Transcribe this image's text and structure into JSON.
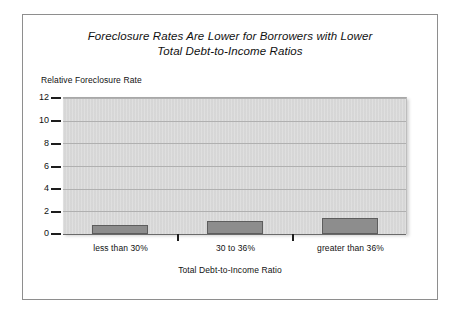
{
  "chart_data": {
    "type": "bar",
    "title": "Foreclosure Rates Are Lower for Borrowers with Lower Total Debt-to-Income Ratios",
    "title_lines": [
      "Foreclosure Rates Are Lower for Borrowers with Lower",
      "Total Debt-to-Income Ratios"
    ],
    "categories": [
      "less than 30%",
      "30 to 36%",
      "greater than 36%"
    ],
    "values": [
      0.8,
      1.1,
      1.4
    ],
    "xlabel": "Total Debt-to-Income Ratio",
    "ylabel": "Relative Foreclosure Rate",
    "ylim": [
      0,
      12
    ],
    "ytick_labels": [
      "12",
      "10",
      "8",
      "6",
      "4",
      "2",
      "0"
    ],
    "ytick_values": [
      12,
      10,
      8,
      6,
      4,
      2,
      0
    ],
    "grid": true,
    "legend": false,
    "legend_position": "none",
    "colors": {
      "bar_fill": "#8d8d8d",
      "bar_border": "#5d5d5d",
      "plot_background": "#d9d9d9",
      "gridline": "#b0b0b0",
      "axis": "#1d1d1d",
      "frame_border": "#8e8e8e",
      "text": "#111111"
    }
  }
}
